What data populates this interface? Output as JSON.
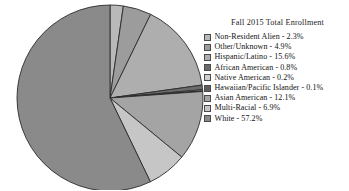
{
  "chart_data": {
    "type": "pie",
    "title": "Fall 2015 Total Enrollment",
    "xlabel": "",
    "ylabel": "",
    "legend_position": "right",
    "grid": false,
    "units": "percent",
    "start_angle_deg": 0,
    "direction": "clockwise",
    "categories": [
      "Non-Resident Alien",
      "Other/Unknown",
      "Hispanic/Latino",
      "African American",
      "Native American",
      "Hawaiian/Pacific Islander",
      "Asian American",
      "Multi-Racial",
      "White"
    ],
    "values": [
      2.3,
      4.9,
      15.6,
      0.8,
      0.2,
      0.1,
      12.1,
      6.9,
      57.2
    ],
    "labels": [
      "Non-Resident Alien - 2.3%",
      "Other/Unknown - 4.9%",
      "Hispanic/Latino - 15.6%",
      "African American - 0.8%",
      "Native American - 0.2%",
      "Hawaiian/Pacific Islander - 0.1%",
      "Asian American - 12.1%",
      "Multi-Racial - 6.9%",
      "White - 57.2%"
    ],
    "colors": [
      "#b9b9b9",
      "#9c9c9c",
      "#aeaeae",
      "#6b6b6b",
      "#cfcfcf",
      "#5e5e5e",
      "#a4a4a4",
      "#c6c6c6",
      "#8a8a8a"
    ],
    "slice_border_color": "#2b2b2b",
    "total": 100.1
  },
  "legend": {
    "title": "Fall 2015 Total Enrollment"
  }
}
